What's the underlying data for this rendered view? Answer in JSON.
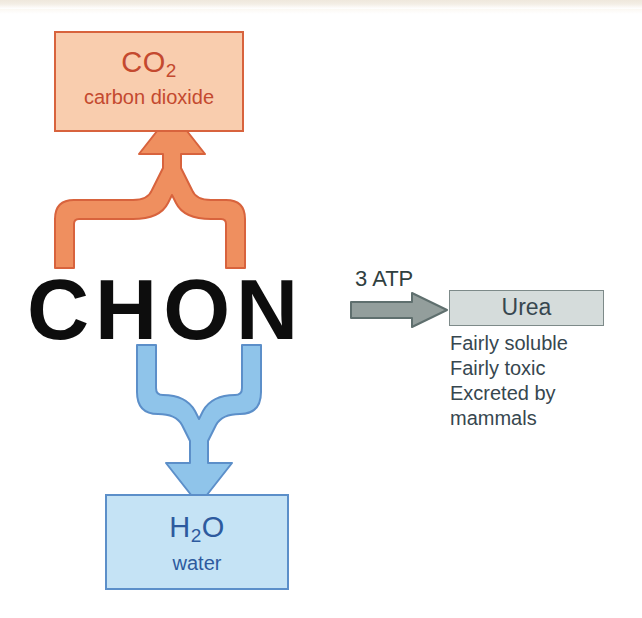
{
  "figure": {
    "background_color": "#ffffff"
  },
  "elements": {
    "source_label": {
      "text": "CHON",
      "color": "#0d0d0d",
      "meaning": "carbon hydrogen oxygen nitrogen"
    },
    "co2_box": {
      "formula_main": "CO",
      "formula_sub": "2",
      "name": "carbon dioxide",
      "fill_color": "#f9cdae",
      "border_color": "#d8633d",
      "text_color": "#c4492f"
    },
    "h2o_box": {
      "formula_main_1": "H",
      "formula_sub": "2",
      "formula_main_2": "O",
      "name": "water",
      "fill_color": "#c5e3f5",
      "border_color": "#5c8fc9",
      "text_color": "#2d5a9e"
    },
    "urea_box": {
      "label": "Urea",
      "fill_color": "#d5dcdb",
      "border_color": "#7d8a89",
      "text_color": "#37474f"
    },
    "urea_notes": [
      "Fairly soluble",
      "Fairly toxic",
      "Excreted by",
      "mammals"
    ],
    "atp_label": {
      "text": "3 ATP",
      "color": "#30403f"
    },
    "arrows": {
      "co2_arrow": {
        "name": "merging-up-arrow",
        "direction": "up",
        "fill_color": "#ef8f5f",
        "stroke_color": "#d8633d",
        "from": "CHON",
        "to": "CO2"
      },
      "h2o_arrow": {
        "name": "merging-down-arrow",
        "direction": "down",
        "fill_color": "#8fc4ea",
        "stroke_color": "#5c8fc9",
        "from": "CHON",
        "to": "H2O"
      },
      "urea_arrow": {
        "name": "right-arrow",
        "direction": "right",
        "fill_color": "#939e9c",
        "stroke_color": "#5f6f6e",
        "from": "CHON",
        "to": "Urea"
      }
    }
  }
}
